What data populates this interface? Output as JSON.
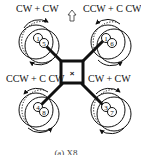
{
  "diagram": {
    "type": "coaxial-octocopter-x8-top-view",
    "forward_arrow": "up-arrow-icon",
    "center_marker": "×",
    "rotors": [
      {
        "position": "front-left",
        "label": "CW + CW",
        "upper_motor": "1",
        "lower_motor": "5"
      },
      {
        "position": "front-right",
        "label": "CCW + C CW",
        "upper_motor": "1",
        "lower_motor": "6"
      },
      {
        "position": "rear-left",
        "label": "CCW + C CW",
        "upper_motor": "4",
        "lower_motor": "8"
      },
      {
        "position": "rear-right",
        "label": "CW + CW",
        "upper_motor": "3",
        "lower_motor": "7"
      }
    ],
    "caption": "(a) X8 ..."
  }
}
